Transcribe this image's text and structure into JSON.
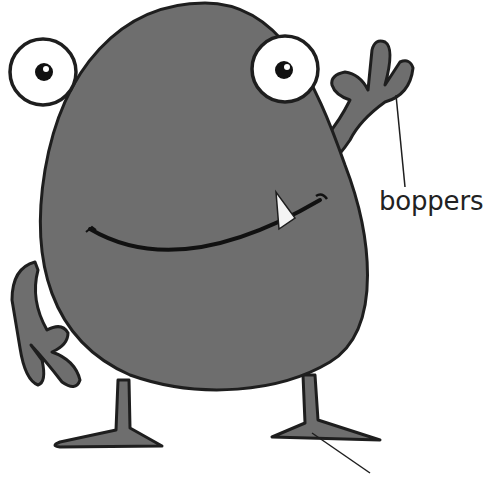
{
  "diagram": {
    "colors": {
      "body": "#6e6e6e",
      "outline": "#1e1e1e",
      "eye_white": "#ffffff",
      "pupil": "#111111",
      "background": "#ffffff"
    },
    "labels": [
      {
        "id": "boppers",
        "text": "boppers",
        "points_to": "right hand"
      },
      {
        "id": "bottom",
        "text": "",
        "points_to": "right foot",
        "note": "label cut off at bottom edge"
      }
    ]
  }
}
